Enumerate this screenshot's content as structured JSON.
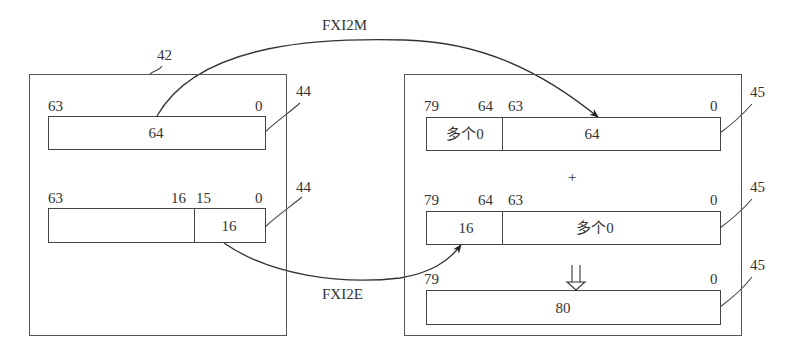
{
  "diagram": {
    "type": "register-conversion",
    "source_unit": {
      "ref": "42",
      "registers": [
        {
          "ref": "44",
          "bit_labels": {
            "high": "63",
            "low": "0"
          },
          "fields": [
            {
              "label": "64",
              "msb": 63,
              "lsb": 0
            }
          ]
        },
        {
          "ref": "44",
          "bit_labels": {
            "high": "63",
            "split_high": "16",
            "split_low": "15",
            "low": "0"
          },
          "fields": [
            {
              "label": "",
              "msb": 63,
              "lsb": 16
            },
            {
              "label": "16",
              "msb": 15,
              "lsb": 0
            }
          ]
        }
      ]
    },
    "target_unit": {
      "registers": [
        {
          "ref": "45",
          "bit_labels": {
            "high": "79",
            "split_high": "64",
            "split_low": "63",
            "low": "0"
          },
          "fields": [
            {
              "label": "多个0",
              "msb": 79,
              "lsb": 64
            },
            {
              "label": "64",
              "msb": 63,
              "lsb": 0
            }
          ]
        },
        {
          "ref": "45",
          "bit_labels": {
            "high": "79",
            "split_high": "64",
            "split_low": "63",
            "low": "0"
          },
          "fields": [
            {
              "label": "16",
              "msb": 79,
              "lsb": 64
            },
            {
              "label": "多个0",
              "msb": 63,
              "lsb": 0
            }
          ]
        },
        {
          "ref": "45",
          "bit_labels": {
            "high": "79",
            "low": "0"
          },
          "fields": [
            {
              "label": "80",
              "msb": 79,
              "lsb": 0
            }
          ]
        }
      ],
      "operator_plus": "+",
      "operator_result": "⇩"
    },
    "transfers": [
      {
        "label": "FXI2M",
        "from": "source.register0",
        "to": "target.register0.low64"
      },
      {
        "label": "FXI2E",
        "from": "source.register1.low16",
        "to": "target.register1.high16"
      }
    ]
  }
}
